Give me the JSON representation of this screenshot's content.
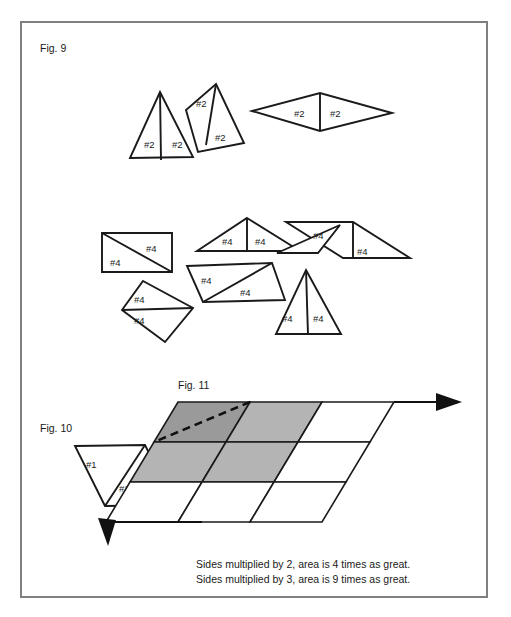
{
  "figure": {
    "frame": {
      "x": 21,
      "y": 22,
      "width": 466,
      "height": 575,
      "stroke": "#808080"
    },
    "fig9": {
      "label": "Fig. 9",
      "label_x": 40,
      "label_y": 52,
      "group_two": {
        "mark": "#2",
        "labels": [
          {
            "text": "#2",
            "x": 144,
            "y": 148
          },
          {
            "text": "#2",
            "x": 172,
            "y": 148
          },
          {
            "text": "#2",
            "x": 200,
            "y": 104
          },
          {
            "text": "#2",
            "x": 228,
            "y": 141
          },
          {
            "text": "#2",
            "x": 296,
            "y": 116
          },
          {
            "text": "#2",
            "x": 330,
            "y": 116
          }
        ]
      },
      "group_four": {
        "mark": "#4",
        "labels": [
          {
            "text": "#4",
            "x": 150,
            "y": 251
          },
          {
            "text": "#4",
            "x": 113,
            "y": 267
          },
          {
            "text": "#4",
            "x": 224,
            "y": 243
          },
          {
            "text": "#4",
            "x": 258,
            "y": 243
          },
          {
            "text": "#4",
            "x": 316,
            "y": 237
          },
          {
            "text": "#4",
            "x": 353,
            "y": 253
          },
          {
            "text": "#4",
            "x": 203,
            "y": 283
          },
          {
            "text": "#4",
            "x": 240,
            "y": 296
          },
          {
            "text": "#4",
            "x": 136,
            "y": 302
          },
          {
            "text": "#4",
            "x": 136,
            "y": 323
          },
          {
            "text": "#4",
            "x": 296,
            "y": 320
          },
          {
            "text": "#4",
            "x": 325,
            "y": 320
          }
        ]
      }
    },
    "fig10": {
      "label": "Fig. 10",
      "label_x": 40,
      "label_y": 428,
      "labels": [
        {
          "text": "#1",
          "x": 92,
          "y": 465
        },
        {
          "text": "#1",
          "x": 122,
          "y": 490
        }
      ]
    },
    "fig11": {
      "label": "Fig. 11",
      "label_x": 176,
      "label_y": 388,
      "grid": {
        "rows": 3,
        "cols": 3,
        "shaded_cells": [
          [
            0,
            0
          ],
          [
            0,
            1
          ],
          [
            1,
            0
          ],
          [
            1,
            1
          ]
        ],
        "dark_cell": [
          0,
          0
        ],
        "shade_color": "#b4b4b4",
        "dark_shade_color": "#9a9a9a",
        "white_color": "#ffffff"
      },
      "captions": [
        "Sides multiplied by 2, area is 4 times as great.",
        "Sides multiplied by 3, area is 9 times as great."
      ],
      "caption_x": 196,
      "caption_y_first": 568,
      "caption_line_height": 15
    }
  }
}
